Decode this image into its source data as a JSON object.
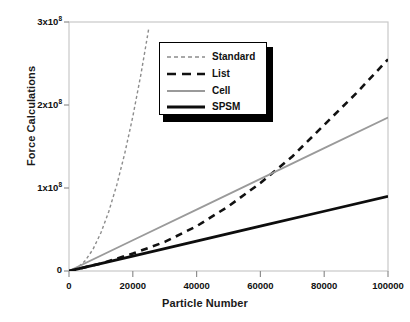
{
  "chart_data": {
    "type": "line",
    "title": "",
    "xlabel": "Particle Number",
    "ylabel": "Force Calculations",
    "xlim": [
      0,
      100000
    ],
    "ylim": [
      0,
      300000000
    ],
    "xticks": [
      0,
      20000,
      40000,
      60000,
      80000,
      100000
    ],
    "xtick_labels": [
      "0",
      "20000",
      "40000",
      "60000",
      "80000",
      "100000"
    ],
    "yticks": [
      0,
      100000000,
      200000000,
      300000000
    ],
    "ytick_labels": [
      "0",
      "1x10",
      "2x10",
      "3x10"
    ],
    "ytick_exponents": [
      "",
      "8",
      "8",
      "8"
    ],
    "grid": false,
    "legend_position": "upper-center",
    "series": [
      {
        "name": "Standard",
        "color": "#8c8c8c",
        "style": "dashed-short",
        "width": 1.4,
        "x": [
          0,
          2500,
          5000,
          7500,
          10000,
          12500,
          15000,
          17500,
          20000,
          22500,
          25000
        ],
        "values": [
          0,
          3500000,
          12000000,
          26000000,
          46000000,
          72000000,
          104000000,
          142000000,
          186000000,
          236000000,
          292000000
        ]
      },
      {
        "name": "List",
        "color": "#111111",
        "style": "dashed-long",
        "width": 2.6,
        "x": [
          0,
          10000,
          20000,
          30000,
          40000,
          50000,
          60000,
          70000,
          80000,
          90000,
          100000
        ],
        "values": [
          0,
          9000000,
          21000000,
          35000000,
          54000000,
          78000000,
          106000000,
          138000000,
          176000000,
          214000000,
          255000000
        ]
      },
      {
        "name": "Cell",
        "color": "#9a9a9a",
        "style": "solid",
        "width": 1.8,
        "x": [
          0,
          20000,
          40000,
          60000,
          80000,
          100000
        ],
        "values": [
          0,
          37000000,
          74000000,
          111000000,
          148000000,
          185000000
        ]
      },
      {
        "name": "SPSM",
        "color": "#0d0d0d",
        "style": "solid",
        "width": 2.8,
        "x": [
          0,
          20000,
          40000,
          60000,
          80000,
          100000
        ],
        "values": [
          0,
          18000000,
          36000000,
          54000000,
          72000000,
          90000000
        ]
      }
    ]
  },
  "legend": {
    "items": [
      {
        "label": "Standard"
      },
      {
        "label": "List"
      },
      {
        "label": "Cell"
      },
      {
        "label": "SPSM"
      }
    ]
  },
  "axes": {
    "x_title": "Particle Number",
    "y_title": "Force Calculations"
  },
  "colors": {
    "frame": "#c9c9c9",
    "background": "#ffffff",
    "text": "#111111"
  }
}
